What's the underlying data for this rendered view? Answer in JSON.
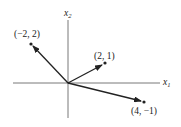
{
  "diagram": {
    "type": "vector-plot",
    "axes": {
      "x_label": "x",
      "x_subscript": "1",
      "y_label": "x",
      "y_subscript": "2"
    },
    "vectors": [
      {
        "label": "(−2, 2)",
        "x": -2,
        "y": 2
      },
      {
        "label": "(2, 1)",
        "x": 2,
        "y": 1
      },
      {
        "label": "(4, −1)",
        "x": 4,
        "y": -1
      }
    ],
    "colors": {
      "ink": "#222222",
      "axis": "#555555",
      "background": "#ffffff"
    }
  }
}
